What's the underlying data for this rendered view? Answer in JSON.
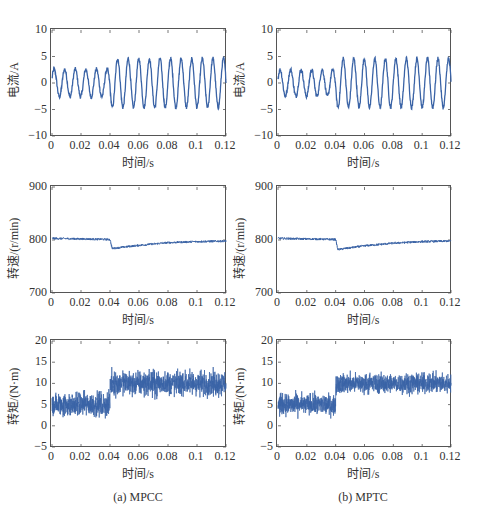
{
  "figure": {
    "captions": [
      "(a) MPCC",
      "(b) MPTC"
    ]
  },
  "colors": {
    "trace": "#3a63a6",
    "axis": "#555555"
  },
  "chart_data": [
    {
      "id": "a-current",
      "column": "(a) MPCC",
      "type": "line",
      "title": "",
      "xlabel": "时间/s",
      "ylabel": "电流/A",
      "xlim": [
        0,
        0.12
      ],
      "ylim": [
        -10,
        10
      ],
      "xticks": [
        "0",
        "0.02",
        "0.04",
        "0.06",
        "0.08",
        "0.1",
        "0.12"
      ],
      "yticks": [
        "10",
        "5",
        "0",
        "-5",
        "-10"
      ],
      "signal": {
        "kind": "sine",
        "period_s": 0.0073,
        "segments": [
          {
            "t0": 0,
            "t1": 0.04,
            "amplitude": 2.6,
            "offset": 0,
            "noise": 0.4
          },
          {
            "t0": 0.04,
            "t1": 0.12,
            "amplitude": 4.6,
            "offset": 0,
            "noise": 0.4
          }
        ]
      }
    },
    {
      "id": "b-current",
      "column": "(b) MPTC",
      "type": "line",
      "title": "",
      "xlabel": "时间/s",
      "ylabel": "电流/A",
      "xlim": [
        0,
        0.12
      ],
      "ylim": [
        -10,
        10
      ],
      "xticks": [
        "0",
        "0.02",
        "0.04",
        "0.06",
        "0.08",
        "0.1",
        "0.12"
      ],
      "yticks": [
        "10",
        "5",
        "0",
        "-5",
        "-10"
      ],
      "signal": {
        "kind": "sine",
        "period_s": 0.0073,
        "segments": [
          {
            "t0": 0,
            "t1": 0.04,
            "amplitude": 2.5,
            "offset": 0,
            "noise": 0.4
          },
          {
            "t0": 0.04,
            "t1": 0.12,
            "amplitude": 4.6,
            "offset": 0,
            "noise": 0.4
          }
        ]
      }
    },
    {
      "id": "a-speed",
      "column": "(a) MPCC",
      "type": "line",
      "title": "",
      "xlabel": "时间/s",
      "ylabel": "转速/(r/min)",
      "xlim": [
        0,
        0.12
      ],
      "ylim": [
        700,
        900
      ],
      "xticks": [
        "0",
        "0.02",
        "0.04",
        "0.06",
        "0.08",
        "0.1",
        "0.12"
      ],
      "yticks": [
        "900",
        "800",
        "700"
      ],
      "signal": {
        "kind": "step-recovery",
        "points": [
          {
            "t": 0,
            "v": 803
          },
          {
            "t": 0.04,
            "v": 801
          },
          {
            "t": 0.0415,
            "v": 784
          },
          {
            "t": 0.06,
            "v": 790
          },
          {
            "t": 0.08,
            "v": 795
          },
          {
            "t": 0.1,
            "v": 797
          },
          {
            "t": 0.12,
            "v": 798
          }
        ],
        "noise": 2.0
      }
    },
    {
      "id": "b-speed",
      "column": "(b) MPTC",
      "type": "line",
      "title": "",
      "xlabel": "时间/s",
      "ylabel": "转速/(r/min)",
      "xlim": [
        0,
        0.12
      ],
      "ylim": [
        700,
        900
      ],
      "xticks": [
        "0",
        "0.02",
        "0.04",
        "0.06",
        "0.08",
        "0.1",
        "0.12"
      ],
      "yticks": [
        "900",
        "800",
        "700"
      ],
      "signal": {
        "kind": "step-recovery",
        "points": [
          {
            "t": 0,
            "v": 803
          },
          {
            "t": 0.04,
            "v": 801
          },
          {
            "t": 0.0415,
            "v": 782
          },
          {
            "t": 0.06,
            "v": 789
          },
          {
            "t": 0.08,
            "v": 794
          },
          {
            "t": 0.1,
            "v": 797
          },
          {
            "t": 0.12,
            "v": 798
          }
        ],
        "noise": 2.0
      }
    },
    {
      "id": "a-torque",
      "column": "(a) MPCC",
      "type": "line",
      "title": "",
      "xlabel": "时间/s",
      "ylabel": "转矩/(N·m)",
      "xlim": [
        0,
        0.12
      ],
      "ylim": [
        -5,
        20
      ],
      "xticks": [
        "0",
        "0.02",
        "0.04",
        "0.06",
        "0.08",
        "0.1",
        "0.12"
      ],
      "yticks": [
        "20",
        "15",
        "10",
        "5",
        "0",
        "-5"
      ],
      "signal": {
        "kind": "noisy-step",
        "segments": [
          {
            "t0": 0,
            "t1": 0.04,
            "mean": 5,
            "band": 3.2
          },
          {
            "t0": 0.04,
            "t1": 0.12,
            "mean": 10,
            "band": 3.3
          }
        ]
      }
    },
    {
      "id": "b-torque",
      "column": "(b) MPTC",
      "type": "line",
      "title": "",
      "xlabel": "时间/s",
      "ylabel": "转矩/(N·m)",
      "xlim": [
        0,
        0.12
      ],
      "ylim": [
        -5,
        20
      ],
      "xticks": [
        "0",
        "0.02",
        "0.04",
        "0.06",
        "0.08",
        "0.1",
        "0.12"
      ],
      "yticks": [
        "20",
        "15",
        "10",
        "5",
        "0",
        "-5"
      ],
      "signal": {
        "kind": "noisy-step",
        "segments": [
          {
            "t0": 0,
            "t1": 0.04,
            "mean": 5,
            "band": 2.8
          },
          {
            "t0": 0.04,
            "t1": 0.12,
            "mean": 10,
            "band": 2.6
          }
        ]
      }
    }
  ]
}
